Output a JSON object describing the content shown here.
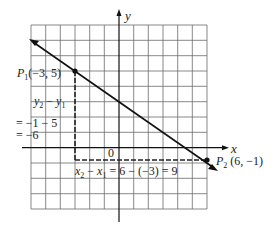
{
  "diagram": {
    "axes": {
      "x_label": "x",
      "y_label": "y",
      "origin_label": "0"
    },
    "points": {
      "p1": {
        "name": "P",
        "sub": "1",
        "coords": "(−3, 5)",
        "x": -3,
        "y": 5
      },
      "p2": {
        "name": "P",
        "sub": "2",
        "coords": " (6, −1)",
        "x": 6,
        "y": -1
      }
    },
    "vertical_leg": {
      "line1_a": "y",
      "line1_a_sub": "2",
      "line1_op": " − ",
      "line1_b": "y",
      "line1_b_sub": "1",
      "line2": "= −1 − 5",
      "line3": "= −6"
    },
    "horizontal_leg": {
      "a": "x",
      "a_sub": "2",
      "op": " − ",
      "b": "x",
      "b_sub": "1",
      "rest": " = 6 − (−3) = 9"
    },
    "colors": {
      "grid": "#555555",
      "line": "#1a1a1a",
      "dashed": "#333333"
    }
  }
}
